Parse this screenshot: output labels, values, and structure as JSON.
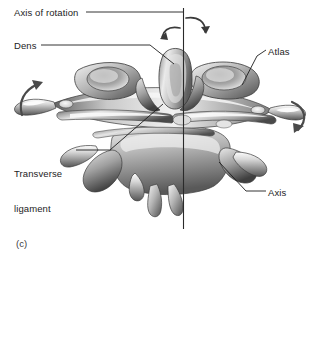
{
  "figure": {
    "caption": "(c)",
    "background_color": "#ffffff",
    "ink_color": "#1d1d1d"
  },
  "labels": [
    {
      "id": "axis-of-rotation",
      "text": "Axis of rotation",
      "x": 14,
      "y": 7,
      "leader": {
        "x1": 86,
        "y1": 12,
        "x2": 183,
        "y2": 12
      }
    },
    {
      "id": "dens",
      "text": "Dens",
      "x": 14,
      "y": 40,
      "leader_points": "41,45 150,45 173,63"
    },
    {
      "id": "atlas",
      "text": "Atlas",
      "x": 268,
      "y": 46,
      "leader_points": "265,50 257,56 243,84"
    },
    {
      "id": "transverse-ligament",
      "text": "Transverse\nligament",
      "line1": "Transverse",
      "line2": "ligament",
      "x": 14,
      "y": 145,
      "leader_points": "76,150 110,150 163,104"
    },
    {
      "id": "axis",
      "text": "Axis",
      "x": 268,
      "y": 187,
      "leader_points": "265,191 246,191 220,163"
    }
  ],
  "axis_line": {
    "id": "axis-of-rotation-line",
    "x": 183.5,
    "y_top": 8,
    "y_bottom": 229,
    "color": "#2a2a2a"
  },
  "rotation_arrows": [
    {
      "id": "arrow-top-right",
      "direction": "clockwise"
    },
    {
      "id": "arrow-top-left",
      "direction": "counterclockwise"
    },
    {
      "id": "arrow-left-lateral",
      "direction": "upward"
    },
    {
      "id": "arrow-right-lateral",
      "direction": "downward"
    }
  ],
  "anatomy": {
    "dens_name": "Dens",
    "atlas_name": "Atlas",
    "axis_name": "Axis",
    "ligament_name": "Transverse ligament"
  }
}
